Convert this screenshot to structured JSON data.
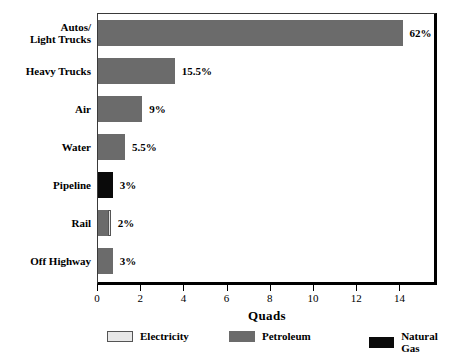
{
  "chart_data": {
    "type": "bar",
    "orientation": "horizontal",
    "stacked": true,
    "title": "",
    "xlabel": "Quads",
    "ylabel": "",
    "xlim": [
      0,
      15.6
    ],
    "xticks": [
      0,
      2,
      4,
      6,
      8,
      10,
      12,
      14
    ],
    "xticklabels": [
      "0",
      "2",
      "4",
      "6",
      "8",
      "10",
      "12",
      "14"
    ],
    "grid": false,
    "legend_position": "bottom",
    "categories": [
      "Autos/ Light Trucks",
      "Heavy Trucks",
      "Air",
      "Water",
      "Pipeline",
      "Rail",
      "Off Highway"
    ],
    "series": [
      {
        "name": "Electricity",
        "color": "#e8e8e8",
        "values": [
          0,
          0,
          0,
          0,
          0,
          0.14,
          0
        ]
      },
      {
        "name": "Petroleum",
        "color": "#6b6b6b",
        "values": [
          14.1,
          3.55,
          2.05,
          1.25,
          0,
          0.45,
          0.68
        ]
      },
      {
        "name": "Natural Gas",
        "color": "#0a0a0a",
        "values": [
          0,
          0,
          0,
          0,
          0.68,
          0,
          0
        ]
      }
    ],
    "data_labels": [
      "62%",
      "15.5%",
      "9%",
      "5.5%",
      "3%",
      "2%",
      "3%"
    ],
    "rows": [
      {
        "label_line1": "Autos/",
        "label_line2": "Light Trucks",
        "value_label": "62%",
        "total": 14.1,
        "segments": [
          {
            "series": "Petroleum",
            "value": 14.1
          }
        ]
      },
      {
        "label_line1": "Heavy Trucks",
        "label_line2": "",
        "value_label": "15.5%",
        "total": 3.55,
        "segments": [
          {
            "series": "Petroleum",
            "value": 3.55
          }
        ]
      },
      {
        "label_line1": "Air",
        "label_line2": "",
        "value_label": "9%",
        "total": 2.05,
        "segments": [
          {
            "series": "Petroleum",
            "value": 2.05
          }
        ]
      },
      {
        "label_line1": "Water",
        "label_line2": "",
        "value_label": "5.5%",
        "total": 1.25,
        "segments": [
          {
            "series": "Petroleum",
            "value": 1.25
          }
        ]
      },
      {
        "label_line1": "Pipeline",
        "label_line2": "",
        "value_label": "3%",
        "total": 0.68,
        "segments": [
          {
            "series": "Natural Gas",
            "value": 0.68
          }
        ]
      },
      {
        "label_line1": "Rail",
        "label_line2": "",
        "value_label": "2%",
        "total": 0.59,
        "segments": [
          {
            "series": "Petroleum",
            "value": 0.45
          },
          {
            "series": "Electricity",
            "value": 0.14
          }
        ]
      },
      {
        "label_line1": "Off Highway",
        "label_line2": "",
        "value_label": "3%",
        "total": 0.68,
        "segments": [
          {
            "series": "Petroleum",
            "value": 0.68
          }
        ]
      }
    ],
    "legend": [
      {
        "label": "Electricity",
        "color": "#e8e8e8"
      },
      {
        "label": "Petroleum",
        "color": "#6b6b6b"
      },
      {
        "label": "Natural Gas",
        "color": "#0a0a0a"
      }
    ]
  }
}
